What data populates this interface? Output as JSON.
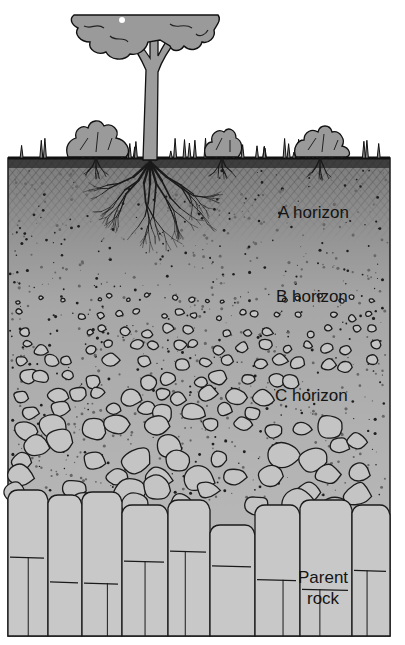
{
  "diagram": {
    "labels": {
      "a_horizon": "A horizon",
      "b_horizon": "B horizon",
      "c_horizon": "C horizon",
      "parent_rock_line1": "Parent",
      "parent_rock_line2": "rock"
    },
    "layers": [
      {
        "name": "A horizon",
        "description": "topsoil with dense roots and organic matter"
      },
      {
        "name": "B horizon",
        "description": "subsoil with scattered pebbles"
      },
      {
        "name": "C horizon",
        "description": "weathered rock fragments"
      },
      {
        "name": "Parent rock",
        "description": "fractured bedrock"
      }
    ],
    "surface_features": [
      "tree",
      "shrub",
      "shrub",
      "shrub",
      "grass"
    ],
    "colors": {
      "soil_gray": "#a9a9a9",
      "rock_light": "#c6c6c6",
      "ink": "#141414",
      "foliage": "#9a9a9a"
    }
  }
}
